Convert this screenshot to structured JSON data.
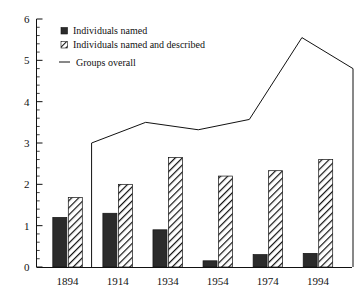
{
  "chart_data": {
    "type": "bar",
    "title": "",
    "subtitle": "",
    "xlabel": "",
    "ylabel": "",
    "categories": [
      "1894",
      "1914",
      "1934",
      "1954",
      "1974",
      "1994"
    ],
    "ylim": [
      0,
      6
    ],
    "xlim_note": "categorical, 6 decade groups",
    "y_ticks_major": [
      "0",
      "1",
      "2",
      "3",
      "4",
      "5",
      "6"
    ],
    "y_minor_tick_step": 0.2,
    "grid": false,
    "legend_position": "upper-left-inside",
    "series": [
      {
        "name": "Individuals named",
        "render": "bar",
        "fill": "solid-black",
        "values": [
          1.2,
          1.3,
          0.9,
          0.15,
          0.3,
          0.33
        ]
      },
      {
        "name": "Individuals named and described",
        "render": "bar",
        "fill": "diagonal-hatch",
        "values": [
          1.68,
          2.0,
          2.65,
          2.2,
          2.33,
          2.6
        ]
      },
      {
        "name": "Groups overall",
        "render": "line",
        "fill": "none",
        "vertices": [
          {
            "x_frac": 0.175,
            "y": 0.0
          },
          {
            "x_frac": 0.175,
            "y": 3.0
          },
          {
            "x_frac": 0.355,
            "y": 3.5
          },
          {
            "x_frac": 0.53,
            "y": 3.32
          },
          {
            "x_frac": 0.7,
            "y": 3.57
          },
          {
            "x_frac": 0.875,
            "y": 5.55
          },
          {
            "x_frac": 1.045,
            "y": 4.8
          },
          {
            "x_frac": 1.045,
            "y": 0.0
          }
        ]
      }
    ]
  },
  "legend": {
    "items": [
      {
        "label": "Individuals named",
        "marker": "solid-square-marker"
      },
      {
        "label": "Individuals named and described",
        "marker": "hatched-square-marker"
      },
      {
        "label": "Groups overall",
        "marker": "line-segment-marker"
      }
    ]
  },
  "axes": {
    "y_labels": [
      "6",
      "5",
      "4",
      "3",
      "2",
      "1",
      "0"
    ],
    "x_labels": [
      "1894",
      "1914",
      "1934",
      "1954",
      "1974",
      "1994"
    ]
  },
  "colors": {
    "axis": "#111111",
    "bar_solid": "#2b2b2b",
    "bar_hatch_stroke": "#111111",
    "line": "#111111",
    "background": "#ffffff"
  }
}
